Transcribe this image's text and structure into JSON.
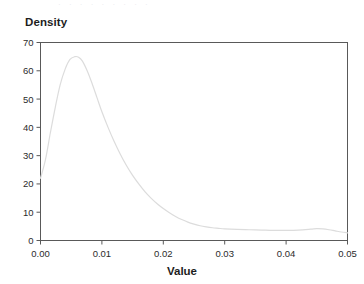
{
  "figure": {
    "top_artifact_text": "· · ·   · ·      · ·     · ·",
    "background_color": "#ffffff",
    "frame_color": "#595959",
    "curve_color": "#dcdcdc",
    "tick_label_color": "#2b2b2b"
  },
  "chart_data": {
    "type": "line",
    "title": "",
    "ylabel": "Density",
    "xlabel": "Value",
    "xlim": [
      0.0,
      0.05
    ],
    "ylim": [
      0,
      70
    ],
    "grid": false,
    "legend": null,
    "x_ticks": [
      0.0,
      0.01,
      0.02,
      0.03,
      0.04,
      0.05
    ],
    "x_tick_labels": [
      "0.00",
      "0.01",
      "0.02",
      "0.03",
      "0.04",
      "0.05"
    ],
    "y_ticks": [
      0,
      10,
      20,
      30,
      40,
      50,
      60,
      70
    ],
    "y_tick_labels": [
      "0",
      "10",
      "20",
      "30",
      "40",
      "50",
      "60",
      "70"
    ],
    "series": [
      {
        "name": "density",
        "color": "#dcdcdc",
        "x": [
          0.0,
          0.0008,
          0.0016,
          0.0024,
          0.0032,
          0.004,
          0.0048,
          0.0056,
          0.0062,
          0.0068,
          0.0076,
          0.0084,
          0.0092,
          0.01,
          0.011,
          0.012,
          0.013,
          0.014,
          0.015,
          0.016,
          0.017,
          0.018,
          0.019,
          0.02,
          0.021,
          0.022,
          0.023,
          0.024,
          0.025,
          0.026,
          0.027,
          0.028,
          0.029,
          0.03,
          0.032,
          0.034,
          0.036,
          0.038,
          0.04,
          0.042,
          0.044,
          0.045,
          0.046,
          0.047,
          0.048,
          0.049,
          0.05
        ],
        "y": [
          22.0,
          28.5,
          38.0,
          47.0,
          55.0,
          60.5,
          64.0,
          65.0,
          64.8,
          63.5,
          60.0,
          55.5,
          50.5,
          45.5,
          40.0,
          35.0,
          30.5,
          26.5,
          23.0,
          20.0,
          17.3,
          15.0,
          13.0,
          11.3,
          9.8,
          8.5,
          7.4,
          6.5,
          5.8,
          5.2,
          4.8,
          4.5,
          4.3,
          4.1,
          3.9,
          3.8,
          3.7,
          3.6,
          3.6,
          3.7,
          4.0,
          4.2,
          4.1,
          3.8,
          3.4,
          3.0,
          2.7
        ]
      }
    ]
  }
}
